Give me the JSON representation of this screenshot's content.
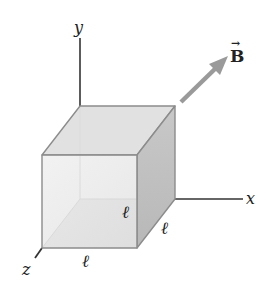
{
  "diagram": {
    "axes": {
      "x_label": "x",
      "y_label": "y",
      "z_label": "z"
    },
    "field": {
      "label": "B",
      "vector_arrow": "→",
      "color": "#9a9a9a"
    },
    "cube": {
      "edge_label_front_bottom": "ℓ",
      "edge_label_front_right": "ℓ",
      "edge_label_depth": "ℓ",
      "edge_color": "#8c8c8c",
      "front_face_color": "#e6e6e6",
      "top_face_color": "#dcdcdc",
      "side_face_color": "#bdbdbd",
      "bottom_face_color": "#d6d6d6"
    },
    "axis_color": "#333333"
  }
}
